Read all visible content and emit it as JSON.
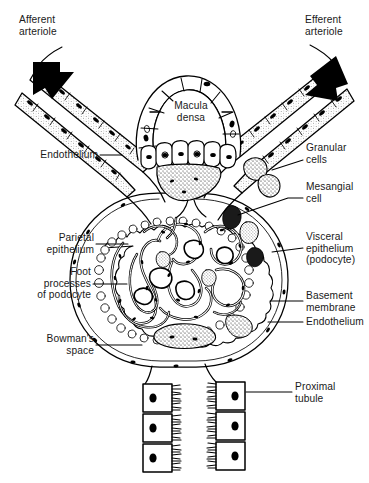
{
  "figure": {
    "background_color": "#ffffff",
    "ink_color": "#000000",
    "width": 369,
    "height": 483
  },
  "labels": {
    "afferent_arteriole": "Afferent\narteriole",
    "efferent_arteriole": "Efferent\narteriole",
    "macula_densa": "Macula\ndensa",
    "endothelium_top": "Endothelium",
    "granular_cells": "Granular\ncells",
    "mesangial_cell": "Mesangial\ncell",
    "parietal_epithelium": "Parietal\nepithelium",
    "visceral_epithelium": "Visceral\nepithelium\n(podocyte)",
    "foot_processes": "Foot\nprocesses\nof podocyte",
    "basement_membrane": "Basement\nmembrane",
    "endothelium_right": "Endothelium",
    "bowmans_space": "Bowman's\nspace",
    "proximal_tubule": "Proximal\ntubule"
  },
  "structures": {
    "arrows": [
      {
        "name": "blood-inflow-arrow",
        "direction": "down-right",
        "side": "left"
      },
      {
        "name": "blood-outflow-arrow",
        "direction": "up-right",
        "side": "right"
      }
    ],
    "capillary_loops": 14,
    "proximal_tubule_cells_per_side": 3,
    "macula_densa_cells": 9
  }
}
